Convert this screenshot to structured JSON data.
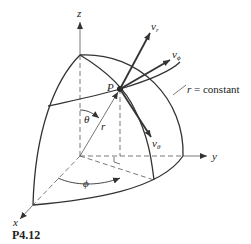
{
  "figure": {
    "caption": "P4.12",
    "axes": {
      "x": "x",
      "y": "y",
      "z": "z"
    },
    "point_label": "P",
    "vectors": {
      "v_r": "v",
      "v_r_sub": "r",
      "v_phi": "v",
      "v_phi_sub": "ϕ",
      "v_theta": "v",
      "v_theta_sub": "θ"
    },
    "angles": {
      "theta": "θ",
      "phi": "ϕ"
    },
    "radius_label": "r",
    "surface_label_var": "r",
    "surface_label_text": " = constant",
    "colors": {
      "line": "#333333",
      "background": "#ffffff"
    }
  }
}
